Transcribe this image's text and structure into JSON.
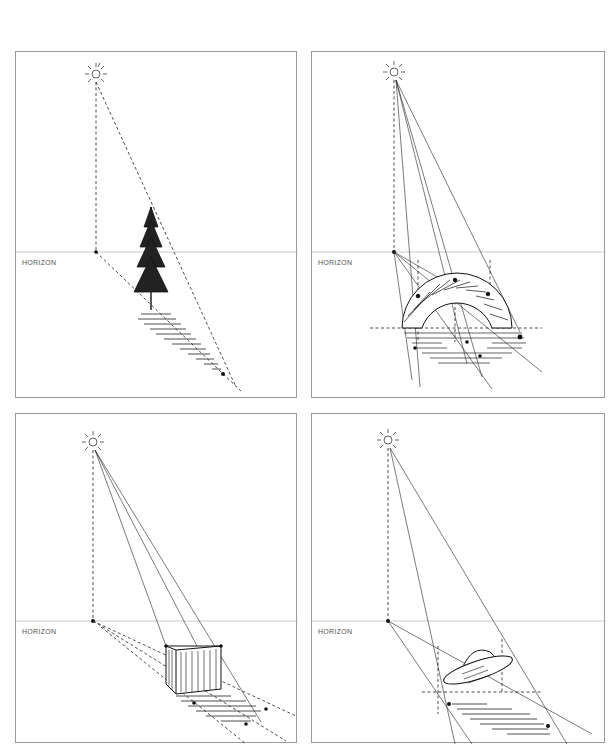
{
  "panels": [
    {
      "id": "tree",
      "subject": "tree",
      "horizon_label": "HORIZON",
      "light_source": "sun"
    },
    {
      "id": "arch",
      "subject": "arch",
      "horizon_label": "HORIZON",
      "light_source": "sun"
    },
    {
      "id": "box",
      "subject": "box",
      "horizon_label": "HORIZON",
      "light_source": "sun"
    },
    {
      "id": "saucer",
      "subject": "flying-saucer",
      "horizon_label": "HORIZON",
      "light_source": "sun"
    }
  ],
  "colors": {
    "ink": "#1a1a1a",
    "border": "#9a9a9a",
    "horizon": "#bdbdbd"
  }
}
